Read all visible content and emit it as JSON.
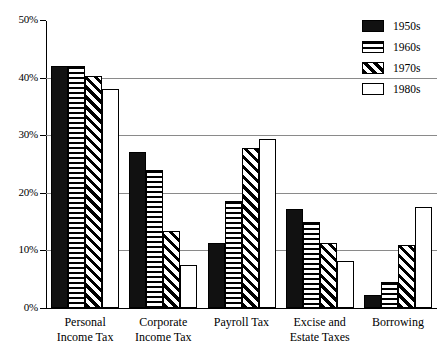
{
  "chart_data": {
    "type": "bar",
    "title": "",
    "xlabel": "",
    "ylabel": "",
    "ylim": [
      0,
      50
    ],
    "yticks": [
      0,
      10,
      20,
      30,
      40,
      50
    ],
    "ytick_labels": [
      "0%",
      "10%",
      "20%",
      "30%",
      "40%",
      "50%"
    ],
    "grid": true,
    "legend_position": "top-right",
    "categories": [
      "Personal Income Tax",
      "Corporate Income Tax",
      "Payroll Tax",
      "Excise and Estate Taxes",
      "Borrowing"
    ],
    "category_lines": [
      [
        "Personal",
        "Income Tax"
      ],
      [
        "Corporate",
        "Income Tax"
      ],
      [
        "Payroll Tax",
        ""
      ],
      [
        "Excise and",
        "Estate Taxes"
      ],
      [
        "Borrowing",
        ""
      ]
    ],
    "series": [
      {
        "name": "1950s",
        "pattern": "solid-black",
        "values": [
          42.0,
          27.0,
          11.3,
          17.2,
          2.2
        ]
      },
      {
        "name": "1960s",
        "pattern": "horizontal-lines",
        "values": [
          42.0,
          24.0,
          18.5,
          15.0,
          4.5
        ]
      },
      {
        "name": "1970s",
        "pattern": "diagonal-hatch",
        "values": [
          40.3,
          13.3,
          27.8,
          11.3,
          11.0
        ]
      },
      {
        "name": "1980s",
        "pattern": "white-empty",
        "values": [
          38.0,
          7.5,
          29.3,
          8.2,
          17.5
        ]
      }
    ]
  },
  "legend": {
    "items": [
      {
        "label": "1950s"
      },
      {
        "label": "1960s"
      },
      {
        "label": "1970s"
      },
      {
        "label": "1980s"
      }
    ]
  },
  "colors": {
    "bar_outline": "#000000",
    "fill_solid": "#111111",
    "fill_empty": "#ffffff",
    "gridline": "#8a8a8a",
    "axis": "#000000",
    "background": "#ffffff"
  }
}
